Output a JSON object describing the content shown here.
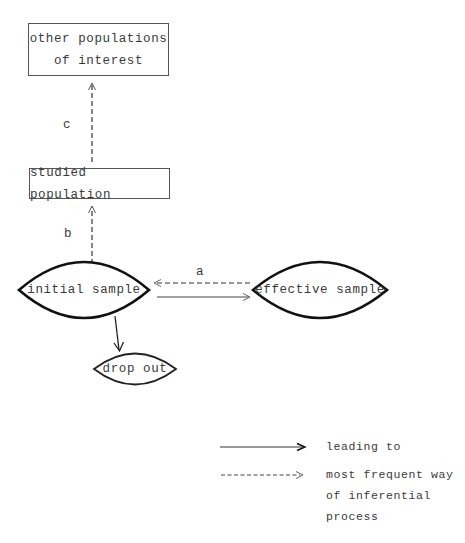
{
  "diagram": {
    "nodes": {
      "other_populations": {
        "lines": [
          "other populations",
          "of interest"
        ],
        "shape": "rectangle"
      },
      "studied_population": {
        "label": "studied population",
        "shape": "rectangle"
      },
      "initial_sample": {
        "label": "initial sample",
        "shape": "lens"
      },
      "effective_sample": {
        "label": "effective sample",
        "shape": "lens"
      },
      "drop_out": {
        "label": "drop out",
        "shape": "lens"
      }
    },
    "edges": [
      {
        "from": "studied_population",
        "to": "other_populations",
        "style": "dashed",
        "label": "c"
      },
      {
        "from": "initial_sample",
        "to": "studied_population",
        "style": "dashed",
        "label": "b"
      },
      {
        "from": "effective_sample",
        "to": "initial_sample",
        "style": "dashed",
        "label": "a"
      },
      {
        "from": "initial_sample",
        "to": "effective_sample",
        "style": "solid",
        "label": ""
      },
      {
        "from": "initial_sample",
        "to": "drop_out",
        "style": "solid",
        "label": ""
      }
    ],
    "edge_labels": {
      "a": "a",
      "b": "b",
      "c": "c"
    }
  },
  "legend": {
    "solid": {
      "label": "leading to",
      "style": "solid"
    },
    "dashed": {
      "lines": [
        "most frequent way",
        "of inferential",
        "process"
      ],
      "style": "dashed"
    }
  },
  "colors": {
    "line": "#222222",
    "text": "#3a3a3a",
    "background": "#ffffff"
  }
}
